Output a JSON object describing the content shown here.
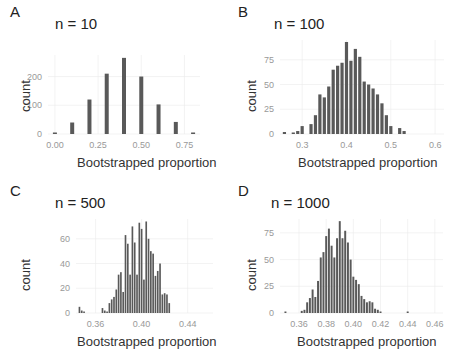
{
  "panels": [
    {
      "letter": "A",
      "title": "n = 10",
      "xlabel": "Bootstrapped proportion",
      "ylabel": "count"
    },
    {
      "letter": "B",
      "title": "n = 100",
      "xlabel": "Bootstrapped proportion",
      "ylabel": "count"
    },
    {
      "letter": "C",
      "title": "n = 500",
      "xlabel": "Bootstrapped proportion",
      "ylabel": "count"
    },
    {
      "letter": "D",
      "title": "n = 1000",
      "xlabel": "Bootstrapped proportion",
      "ylabel": "count"
    }
  ],
  "style": {
    "bar_color": "#595959",
    "grid_color": "#ebebeb",
    "tick_color": "#999999"
  },
  "chart_data": [
    {
      "type": "bar",
      "panel": "A",
      "title": "n = 10",
      "xlabel": "Bootstrapped proportion",
      "ylabel": "count",
      "x": [
        0.0,
        0.1,
        0.2,
        0.3,
        0.4,
        0.5,
        0.6,
        0.7,
        0.8
      ],
      "values": [
        2,
        40,
        120,
        210,
        265,
        200,
        103,
        42,
        5
      ],
      "xticks": [
        0.0,
        0.25,
        0.5,
        0.75
      ],
      "xtick_labels": [
        "0.00",
        "0.25",
        "0.50",
        "0.75"
      ],
      "yticks": [
        0,
        100,
        200
      ],
      "xlim": [
        -0.04,
        0.84
      ],
      "ylim": [
        0,
        275
      ],
      "grid": true
    },
    {
      "type": "bar",
      "panel": "B",
      "title": "n = 100",
      "xlabel": "Bootstrapped proportion",
      "ylabel": "count",
      "x": [
        0.26,
        0.28,
        0.29,
        0.3,
        0.32,
        0.33,
        0.34,
        0.35,
        0.36,
        0.37,
        0.38,
        0.39,
        0.4,
        0.41,
        0.42,
        0.43,
        0.44,
        0.45,
        0.46,
        0.47,
        0.48,
        0.49,
        0.5,
        0.52,
        0.53
      ],
      "values": [
        2,
        1,
        3,
        8,
        10,
        19,
        40,
        37,
        48,
        65,
        69,
        72,
        93,
        74,
        86,
        78,
        53,
        50,
        46,
        40,
        31,
        19,
        8,
        6,
        3
      ],
      "xticks": [
        0.3,
        0.4,
        0.5,
        0.6
      ],
      "xtick_labels": [
        "0.3",
        "0.4",
        "0.5",
        "0.6"
      ],
      "yticks": [
        0,
        25,
        50,
        75
      ],
      "xlim": [
        0.25,
        0.62
      ],
      "ylim": [
        0,
        95
      ],
      "grid": true
    },
    {
      "type": "bar",
      "panel": "C",
      "title": "n = 500",
      "xlabel": "Bootstrapped proportion",
      "ylabel": "count",
      "x": [
        0.346,
        0.348,
        0.35,
        0.352,
        0.354,
        0.356,
        0.358,
        0.36,
        0.362,
        0.364,
        0.366,
        0.368,
        0.37,
        0.372,
        0.374,
        0.376,
        0.378,
        0.38,
        0.382,
        0.384,
        0.386,
        0.388,
        0.39,
        0.392,
        0.394,
        0.396,
        0.398,
        0.4,
        0.402,
        0.404,
        0.406,
        0.408,
        0.41,
        0.412,
        0.414,
        0.416,
        0.418,
        0.42,
        0.422,
        0.424,
        0.426,
        0.428,
        0.43,
        0.432,
        0.434,
        0.436,
        0.438,
        0.44,
        0.442,
        0.444,
        0.446,
        0.448,
        0.45,
        0.452,
        0.454
      ],
      "values": [
        5,
        2,
        1,
        0,
        0,
        0,
        0,
        0,
        0,
        0,
        4,
        2,
        1,
        8,
        11,
        13,
        19,
        31,
        33,
        17,
        63,
        56,
        31,
        70,
        57,
        31,
        73,
        68,
        27,
        74,
        60,
        50,
        48,
        30,
        34,
        40,
        15,
        16,
        15,
        8,
        0,
        0,
        0,
        0,
        0,
        0,
        0,
        0,
        0,
        0,
        0,
        0,
        0,
        0,
        0
      ],
      "xticks": [
        0.36,
        0.4,
        0.44
      ],
      "xtick_labels": [
        "0.36",
        "0.40",
        "0.44"
      ],
      "yticks": [
        0,
        20,
        40,
        60
      ],
      "xlim": [
        0.343,
        0.462
      ],
      "ylim": [
        0,
        76
      ],
      "grid": true
    },
    {
      "type": "bar",
      "panel": "D",
      "title": "n = 1000",
      "xlabel": "Bootstrapped proportion",
      "ylabel": "count",
      "x": [
        0.35,
        0.362,
        0.364,
        0.366,
        0.368,
        0.37,
        0.372,
        0.374,
        0.376,
        0.378,
        0.38,
        0.382,
        0.384,
        0.386,
        0.388,
        0.39,
        0.392,
        0.394,
        0.396,
        0.398,
        0.4,
        0.402,
        0.404,
        0.406,
        0.408,
        0.41,
        0.412,
        0.414,
        0.416,
        0.418,
        0.42,
        0.422,
        0.424,
        0.426,
        0.428,
        0.43,
        0.432,
        0.434,
        0.436,
        0.44
      ],
      "values": [
        1,
        2,
        3,
        10,
        14,
        22,
        15,
        30,
        52,
        57,
        72,
        79,
        63,
        52,
        70,
        86,
        70,
        77,
        66,
        50,
        34,
        31,
        27,
        16,
        13,
        10,
        11,
        10,
        4,
        3,
        1,
        0,
        0,
        0,
        0,
        0,
        0,
        0,
        0,
        1
      ],
      "xticks": [
        0.36,
        0.38,
        0.4,
        0.42,
        0.44,
        0.46
      ],
      "xtick_labels": [
        "0.36",
        "0.38",
        "0.40",
        "0.42",
        "0.44",
        "0.46"
      ],
      "yticks": [
        0,
        25,
        50,
        75
      ],
      "xlim": [
        0.346,
        0.466
      ],
      "ylim": [
        0,
        88
      ],
      "grid": true
    }
  ]
}
